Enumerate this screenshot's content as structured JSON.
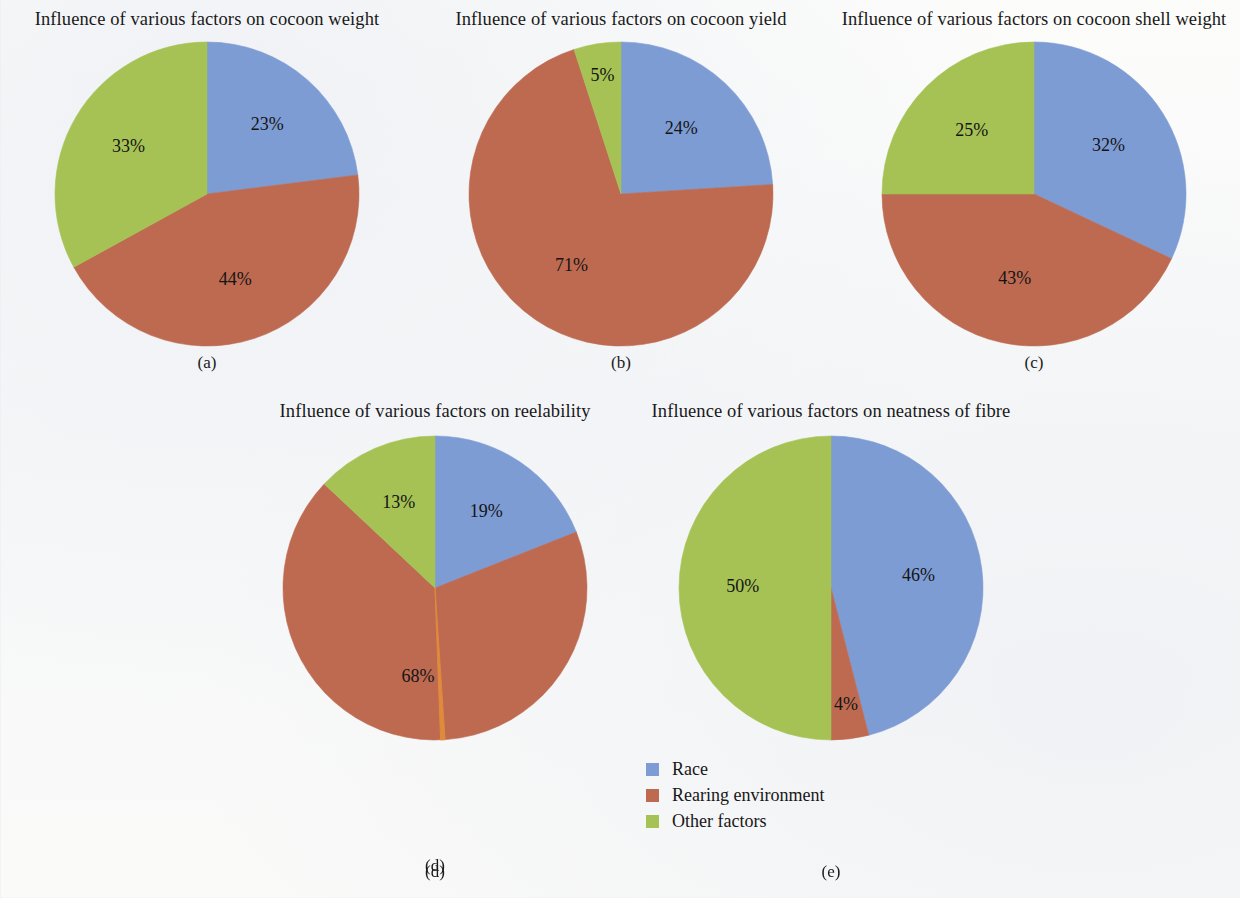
{
  "figure": {
    "background_color": "#fbfbfa"
  },
  "palette": {
    "race": "#7e9cd4",
    "rearing_environment": "#bd6a51",
    "other_factors": "#a6c255",
    "sliver": "#e08a3c",
    "label_text": "#141414"
  },
  "legend": {
    "position": "bottom-center",
    "items": [
      {
        "label": "Race",
        "color": "#7e9cd4",
        "swatch": "square-swatch"
      },
      {
        "label": "Rearing environment",
        "color": "#bd6a51",
        "swatch": "square-swatch"
      },
      {
        "label": "Other factors",
        "color": "#a6c255",
        "swatch": "square-swatch"
      }
    ]
  },
  "panels": [
    {
      "key": "a",
      "title": "Influence of various factors on cocoon weight",
      "subcaption": "(a)",
      "labels": [
        "23%",
        "44%",
        "33%"
      ]
    },
    {
      "key": "b",
      "title": "Influence of various factors on cocoon yield",
      "subcaption": "(b)",
      "labels": [
        "24%",
        "71%",
        "5%"
      ]
    },
    {
      "key": "c",
      "title": "Influence of various factors on cocoon shell weight",
      "subcaption": "(c)",
      "labels": [
        "32%",
        "43%",
        "25%"
      ]
    },
    {
      "key": "d",
      "title": "Influence of various factors on reelability",
      "subcaption": "(d)",
      "labels": [
        "19%",
        "68%",
        "13%"
      ]
    },
    {
      "key": "e",
      "title": "Influence of various factors on neatness of fibre",
      "subcaption": "(e)",
      "labels": [
        "46%",
        "4%",
        "50%"
      ]
    }
  ],
  "chart_data": [
    {
      "type": "pie",
      "id": "a",
      "title": "Influence of various factors on cocoon weight",
      "caption": "(a)",
      "categories": [
        "Race",
        "Rearing environment",
        "Other factors"
      ],
      "values": [
        23,
        44,
        33
      ],
      "value_labels": [
        "23%",
        "44%",
        "33%"
      ],
      "colors": [
        "#7e9cd4",
        "#bd6a51",
        "#a6c255"
      ],
      "units": "percent",
      "start_angle_deg": 0,
      "direction": "clockwise",
      "legend": "shared-bottom"
    },
    {
      "type": "pie",
      "id": "b",
      "title": "Influence of various factors on cocoon yield",
      "caption": "(b)",
      "categories": [
        "Race",
        "Rearing environment",
        "Other factors"
      ],
      "values": [
        24,
        71,
        5
      ],
      "value_labels": [
        "24%",
        "71%",
        "5%"
      ],
      "colors": [
        "#7e9cd4",
        "#bd6a51",
        "#a6c255"
      ],
      "units": "percent",
      "start_angle_deg": 0,
      "direction": "clockwise",
      "legend": "shared-bottom"
    },
    {
      "type": "pie",
      "id": "c",
      "title": "Influence of various factors on cocoon shell weight",
      "caption": "(c)",
      "categories": [
        "Race",
        "Rearing environment",
        "Other factors"
      ],
      "values": [
        32,
        43,
        25
      ],
      "value_labels": [
        "32%",
        "43%",
        "25%"
      ],
      "colors": [
        "#7e9cd4",
        "#bd6a51",
        "#a6c255"
      ],
      "units": "percent",
      "start_angle_deg": 0,
      "direction": "clockwise",
      "legend": "shared-bottom"
    },
    {
      "type": "pie",
      "id": "d",
      "title": "Influence of various factors on reelability",
      "caption": "(d)",
      "categories": [
        "Race",
        "Rearing environment",
        "Other factors"
      ],
      "values": [
        19,
        68,
        13
      ],
      "value_labels": [
        "19%",
        "68%",
        "13%"
      ],
      "colors": [
        "#7e9cd4",
        "#bd6a51",
        "#a6c255"
      ],
      "units": "percent",
      "start_angle_deg": 0,
      "direction": "clockwise",
      "legend": "shared-bottom",
      "annotations": [
        "thin orange sliver near bottom of pie (~0%)"
      ]
    },
    {
      "type": "pie",
      "id": "e",
      "title": "Influence of various factors on neatness of fibre",
      "caption": "(e)",
      "categories": [
        "Race",
        "Rearing environment",
        "Other factors"
      ],
      "values": [
        46,
        4,
        50
      ],
      "value_labels": [
        "46%",
        "4%",
        "50%"
      ],
      "colors": [
        "#7e9cd4",
        "#bd6a51",
        "#a6c255"
      ],
      "units": "percent",
      "start_angle_deg": 0,
      "direction": "clockwise",
      "legend": "shared-bottom"
    }
  ]
}
